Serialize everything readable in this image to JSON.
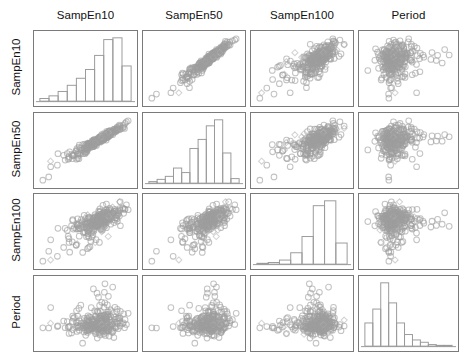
{
  "figure": {
    "type": "scatterplot-matrix",
    "variables": [
      "SampEn10",
      "SampEn50",
      "SampEn100",
      "Period"
    ],
    "n_variables": 4,
    "background": "#ffffff",
    "panel_border_color": "#7a7a7a",
    "marker_circle_color": "#9e9e9e",
    "marker_diamond_color": "#b5b5b5",
    "histogram_stroke_color": "#9a9a9a"
  },
  "column_labels": [
    {
      "text": "SampEn10"
    },
    {
      "text": "SampEn50"
    },
    {
      "text": "SampEn100"
    },
    {
      "text": "Period"
    }
  ],
  "row_labels": [
    {
      "text": "SampEn10"
    },
    {
      "text": "SampEn50"
    },
    {
      "text": "SampEn100"
    },
    {
      "text": "Period"
    }
  ],
  "chart_data": {
    "type": "scatter",
    "title": "",
    "xlabel": "",
    "ylabel": "",
    "grid": false,
    "legend": "none",
    "variables": [
      "SampEn10",
      "SampEn50",
      "SampEn100",
      "Period"
    ],
    "n_points": 300,
    "marker_shapes": [
      "circle",
      "diamond"
    ],
    "diagonal_type": "histogram",
    "histograms": [
      {
        "variable": "SampEn10",
        "shape": "left-skewed ascending with drop at right",
        "bin_counts": [
          3,
          6,
          11,
          18,
          26,
          36,
          52,
          70,
          72,
          40
        ],
        "n_bins": 10
      },
      {
        "variable": "SampEn50",
        "shape": "strongly left-skewed",
        "bin_counts": [
          2,
          5,
          9,
          20,
          14,
          46,
          58,
          76,
          84,
          40,
          6
        ],
        "n_bins": 11
      },
      {
        "variable": "SampEn100",
        "shape": "sharply peaked near right",
        "bin_counts": [
          1,
          2,
          5,
          14,
          34,
          72,
          78,
          26
        ],
        "n_bins": 8
      },
      {
        "variable": "Period",
        "shape": "right-skewed with long tail",
        "bin_counts": [
          30,
          48,
          82,
          56,
          30,
          15,
          8,
          5,
          2,
          1,
          1
        ],
        "n_bins": 11
      }
    ],
    "correlations": [
      {
        "x": "SampEn10",
        "y": "SampEn50",
        "r": 0.97
      },
      {
        "x": "SampEn10",
        "y": "SampEn100",
        "r": 0.72
      },
      {
        "x": "SampEn10",
        "y": "Period",
        "r": 0.18
      },
      {
        "x": "SampEn50",
        "y": "SampEn100",
        "r": 0.78
      },
      {
        "x": "SampEn50",
        "y": "Period",
        "r": 0.2
      },
      {
        "x": "SampEn100",
        "y": "Period",
        "r": 0.22
      }
    ]
  }
}
